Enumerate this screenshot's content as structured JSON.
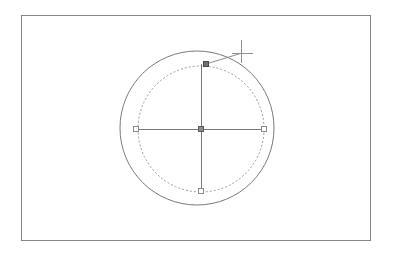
{
  "app": {
    "title": "CAD Drawing Canvas",
    "background_color": "#ffffff"
  },
  "canvas": {
    "width": 393,
    "height": 256,
    "frame": {
      "name": "drawing-frame",
      "x": 21,
      "y": 15,
      "width": 349,
      "height": 225,
      "stroke_color": "#878787",
      "stroke_width": 1,
      "fill": "none"
    }
  },
  "shapes": {
    "original_circle": {
      "label": "original-circle",
      "style": "dashed",
      "center_x": 201,
      "center_y": 129,
      "radius": 63,
      "stroke_color": "#9a9a9a",
      "stroke_width": 1,
      "dash_pattern": "2,2"
    },
    "preview_circle": {
      "label": "preview-circle",
      "style": "solid",
      "center_x": 197,
      "center_y": 128,
      "radius": 77,
      "stroke_color": "#7a7a7a",
      "stroke_width": 1
    }
  },
  "axes": {
    "horizontal": {
      "label": "horizontal-axis-line",
      "x1": 136,
      "y1": 129,
      "x2": 264,
      "y2": 129,
      "stroke_color": "#787878"
    },
    "vertical": {
      "label": "vertical-axis-line",
      "x1": 201,
      "y1": 64,
      "x2": 201,
      "y2": 191,
      "stroke_color": "#787878"
    }
  },
  "grips": [
    {
      "name": "grip-center",
      "x": 201,
      "y": 129,
      "size": 5,
      "state": "selected",
      "fill": "#8c8c8c",
      "stroke": "#5a5a5a"
    },
    {
      "name": "grip-left-quadrant",
      "x": 136,
      "y": 129,
      "size": 5,
      "state": "unselected",
      "fill": "#ffffff",
      "stroke": "#8a8a8a"
    },
    {
      "name": "grip-right-quadrant",
      "x": 264,
      "y": 129,
      "size": 5,
      "state": "unselected",
      "fill": "#ffffff",
      "stroke": "#8a8a8a"
    },
    {
      "name": "grip-bottom-quadrant",
      "x": 201,
      "y": 191,
      "size": 5,
      "state": "unselected",
      "fill": "#ffffff",
      "stroke": "#8a8a8a"
    },
    {
      "name": "grip-top-quadrant",
      "x": 206,
      "y": 64,
      "size": 5,
      "state": "hot-dragging",
      "fill": "#707070",
      "stroke": "#4a4a4a"
    }
  ],
  "rubber_band": {
    "name": "rubber-band-line",
    "x1": 206,
    "y1": 64,
    "x2": 242,
    "y2": 53,
    "stroke_color": "#8e8e8e"
  },
  "cursor": {
    "name": "crosshair-cursor",
    "center_x": 241,
    "center_y": 53,
    "arm_up": 13,
    "arm_down": 10,
    "arm_left": 9,
    "arm_right": 12,
    "stroke_color": "#909090",
    "stroke_width": 1
  },
  "accessibility": {
    "canvas_description": "Drawing canvas showing a dashed original circle and a larger solid preview circle with five grip squares and a crosshair cursor dragging the top quadrant grip."
  }
}
